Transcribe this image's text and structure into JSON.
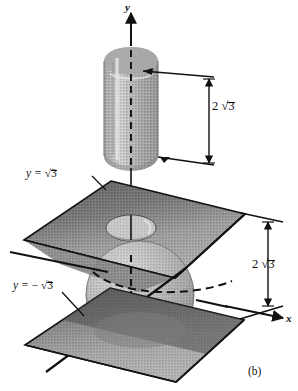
{
  "figure": {
    "caption": "(b)",
    "axes": {
      "y_label": "y",
      "x_label": "x"
    },
    "planes": [
      {
        "name": "upper-plane",
        "label_prefix": "y = ",
        "label_sign": "",
        "label_radicand": "3"
      },
      {
        "name": "lower-plane",
        "label_prefix": "y = ",
        "label_sign": "− ",
        "label_radicand": "3"
      }
    ],
    "dimensions": [
      {
        "name": "upper-dimension",
        "coefficient": "2",
        "radicand": "3"
      },
      {
        "name": "lower-dimension",
        "coefficient": "2",
        "radicand": "3"
      }
    ],
    "colors": {
      "ink": "#111111",
      "background": "#ffffff",
      "cylinder_light": "#b9b9b9",
      "cylinder_mid": "#9a9a9a",
      "cylinder_dark": "#7d7d7d",
      "plane_dark": "#4a4a4a",
      "plane_mid": "#8d8d8d",
      "plane_light": "#a8a8a8",
      "sphere_light": "#c0c0c0",
      "sphere_mid": "#a0a0a0",
      "sphere_dark": "#7a7a7a"
    },
    "solids": [
      {
        "name": "cylinder",
        "description": "vertical gray cylinder along y-axis"
      },
      {
        "name": "sphere",
        "description": "gray sphere centered at origin"
      },
      {
        "name": "upper-plane",
        "description": "horizontal plane at y = sqrt 3 with elliptical hole"
      },
      {
        "name": "lower-plane",
        "description": "horizontal plane at y = minus sqrt 3"
      }
    ]
  }
}
